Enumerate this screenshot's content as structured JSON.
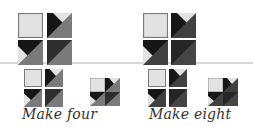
{
  "colors": {
    "light": "#e2e2e2",
    "light_border": "#8a8a8a",
    "medium": "#767676",
    "dark": "#404040",
    "black": "#161616",
    "rule": "#d8d8d8"
  },
  "groups": [
    {
      "name": "four",
      "caption": "Make four",
      "variant": "medium"
    },
    {
      "name": "eight",
      "caption": "Make eight",
      "variant": "dark"
    }
  ]
}
